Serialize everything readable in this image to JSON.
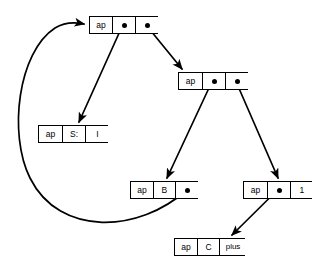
{
  "diagram": {
    "type": "linked-structure",
    "stroke_color": "#000000",
    "background_color": "#ffffff",
    "nodes": [
      {
        "id": "node-root",
        "name": "root-cell",
        "x": 89,
        "y": 16,
        "w": 69,
        "h": 18,
        "cells": [
          {
            "kind": "label",
            "text": "ap",
            "w": 22
          },
          {
            "kind": "pointer",
            "text": "",
            "w": 23
          },
          {
            "kind": "pointer",
            "text": "",
            "w": 24
          }
        ]
      },
      {
        "id": "node-second",
        "name": "second-cell",
        "x": 178,
        "y": 72,
        "w": 70,
        "h": 18,
        "cells": [
          {
            "kind": "label",
            "text": "ap",
            "w": 23
          },
          {
            "kind": "pointer",
            "text": "",
            "w": 23
          },
          {
            "kind": "pointer",
            "text": "",
            "w": 24
          }
        ]
      },
      {
        "id": "node-s",
        "name": "s-cell",
        "x": 38,
        "y": 125,
        "w": 70,
        "h": 18,
        "cells": [
          {
            "kind": "label",
            "text": "ap",
            "w": 23
          },
          {
            "kind": "label",
            "text": "S:",
            "w": 23
          },
          {
            "kind": "label",
            "text": "I",
            "w": 24
          }
        ]
      },
      {
        "id": "node-b",
        "name": "b-cell",
        "x": 130,
        "y": 181,
        "w": 68,
        "h": 18,
        "cells": [
          {
            "kind": "label",
            "text": "ap",
            "w": 22
          },
          {
            "kind": "label",
            "text": "B",
            "w": 22
          },
          {
            "kind": "pointer",
            "text": "",
            "w": 24
          }
        ]
      },
      {
        "id": "node-one",
        "name": "one-cell",
        "x": 243,
        "y": 181,
        "w": 69,
        "h": 18,
        "cells": [
          {
            "kind": "label",
            "text": "ap",
            "w": 23
          },
          {
            "kind": "pointer",
            "text": "",
            "w": 23
          },
          {
            "kind": "label",
            "text": "1",
            "w": 23
          }
        ]
      },
      {
        "id": "node-c",
        "name": "c-plus-cell",
        "x": 174,
        "y": 238,
        "w": 71,
        "h": 18,
        "cells": [
          {
            "kind": "label",
            "text": "ap",
            "w": 22
          },
          {
            "kind": "label",
            "text": "C",
            "w": 22
          },
          {
            "kind": "label",
            "text": "plus",
            "w": 27
          }
        ]
      }
    ],
    "edges": [
      {
        "id": "edge-root-car-to-s",
        "name": "arrow-root-car-to-s-cell",
        "from": "node-root.cell1",
        "to": "node-s",
        "path": "M 122.5 25.5 L 79 122"
      },
      {
        "id": "edge-root-cdr-to-second",
        "name": "arrow-root-cdr-to-second-cell",
        "from": "node-root.cell2",
        "to": "node-second",
        "path": "M 146.5 25.5 L 182 69"
      },
      {
        "id": "edge-second-car-to-b",
        "name": "arrow-second-car-to-b-cell",
        "from": "node-second.cell1",
        "to": "node-b",
        "path": "M 212 81.5 L 167 178"
      },
      {
        "id": "edge-second-cdr-to-one",
        "name": "arrow-second-cdr-to-one-cell",
        "from": "node-second.cell2",
        "to": "node-one",
        "path": "M 236 81.5 L 278 178"
      },
      {
        "id": "edge-one-car-to-c",
        "name": "arrow-one-car-to-c-plus-cell",
        "from": "node-one.cell1",
        "to": "node-c",
        "path": "M 277 190.5 L 232 235"
      },
      {
        "id": "edge-b-cdr-to-root",
        "name": "arrow-b-cdr-back-to-root-cell",
        "from": "node-b.cell2",
        "to": "node-root",
        "path": "M 186 190.5 C 140 232, 60 238, 30 178 C 8 134, 18 52, 55 28 C 65 22, 74 22, 84 24"
      }
    ]
  }
}
